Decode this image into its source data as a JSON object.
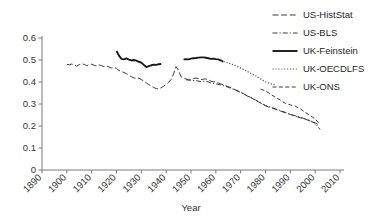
{
  "chart_data": {
    "type": "line",
    "title": "",
    "xlabel": "Year",
    "ylabel": "",
    "xlim": [
      1890,
      2010
    ],
    "ylim": [
      0,
      0.6
    ],
    "grid": false,
    "legend_position": "top-right",
    "xticks": [
      "1890",
      "1900",
      "1910",
      "1920",
      "1930",
      "1940",
      "1950",
      "1960",
      "1970",
      "1980",
      "1990",
      "2000",
      "2010"
    ],
    "yticks": [
      "0",
      "0.1",
      "0.2",
      "0.3",
      "0.4",
      "0.5",
      "0.6"
    ],
    "series": [
      {
        "name": "US-HistStat",
        "style": "long-dash",
        "color": "#3b3b3b",
        "x": [
          1900,
          1901,
          1902,
          1903,
          1904,
          1905,
          1906,
          1907,
          1908,
          1909,
          1910,
          1911,
          1912,
          1913,
          1914,
          1915,
          1916,
          1917,
          1918,
          1919,
          1920,
          1921,
          1922,
          1923,
          1924,
          1925,
          1926,
          1927,
          1928,
          1929,
          1930,
          1931,
          1932,
          1933,
          1934,
          1935,
          1936,
          1937,
          1938,
          1939,
          1940,
          1941,
          1942,
          1943,
          1944,
          1945,
          1946,
          1947,
          1948,
          1949,
          1950,
          1951,
          1952,
          1953,
          1954,
          1955,
          1956,
          1957,
          1958,
          1959,
          1960,
          1961,
          1962,
          1963,
          1964,
          1965,
          1966,
          1967,
          1968,
          1969,
          1970,
          1971,
          1972,
          1973,
          1974,
          1975,
          1976,
          1977,
          1978,
          1979,
          1980,
          1981,
          1982,
          1983,
          1984,
          1985,
          1986,
          1987,
          1988,
          1989,
          1990,
          1991,
          1992,
          1993,
          1994,
          1995,
          1996,
          1997,
          1998,
          1999,
          2000,
          2001,
          2002
        ],
        "y": [
          0.48,
          0.478,
          0.482,
          0.477,
          0.472,
          0.479,
          0.483,
          0.48,
          0.474,
          0.478,
          0.481,
          0.476,
          0.473,
          0.478,
          0.474,
          0.47,
          0.473,
          0.468,
          0.463,
          0.466,
          0.462,
          0.452,
          0.448,
          0.443,
          0.438,
          0.43,
          0.424,
          0.419,
          0.415,
          0.418,
          0.411,
          0.405,
          0.396,
          0.388,
          0.382,
          0.375,
          0.37,
          0.368,
          0.374,
          0.381,
          0.39,
          0.398,
          0.412,
          0.437,
          0.47,
          0.452,
          0.424,
          0.416,
          0.414,
          0.41,
          0.412,
          0.416,
          0.418,
          0.415,
          0.411,
          0.413,
          0.414,
          0.41,
          0.404,
          0.401,
          0.399,
          0.396,
          0.391,
          0.387,
          0.383,
          0.379,
          0.374,
          0.369,
          0.364,
          0.359,
          0.354,
          0.348,
          0.342,
          0.336,
          0.33,
          0.323,
          0.317,
          0.311,
          0.305,
          0.299,
          0.292,
          0.287,
          0.284,
          0.28,
          0.276,
          0.272,
          0.268,
          0.264,
          0.26,
          0.256,
          0.252,
          0.248,
          0.244,
          0.241,
          0.238,
          0.234,
          0.231,
          0.227,
          0.223,
          0.219,
          0.214,
          0.208,
          0.201
        ]
      },
      {
        "name": "US-BLS",
        "style": "dash-dot",
        "color": "#3b3b3b",
        "x": [
          1948,
          1950,
          1952,
          1954,
          1956,
          1958,
          1960,
          1962,
          1964,
          1966,
          1968,
          1970,
          1972,
          1974,
          1976,
          1978,
          1980,
          1982,
          1984,
          1986,
          1988,
          1990,
          1992,
          1994,
          1996,
          1998,
          2000,
          2002
        ],
        "y": [
          0.41,
          0.408,
          0.406,
          0.402,
          0.404,
          0.396,
          0.392,
          0.386,
          0.38,
          0.372,
          0.362,
          0.352,
          0.34,
          0.33,
          0.318,
          0.305,
          0.293,
          0.286,
          0.278,
          0.27,
          0.262,
          0.254,
          0.246,
          0.24,
          0.232,
          0.224,
          0.212,
          0.184
        ]
      },
      {
        "name": "UK-Feinstein",
        "style": "solid",
        "color": "#1a1a1a",
        "x": [
          1920,
          1921,
          1922,
          1923,
          1924,
          1925,
          1926,
          1927,
          1928,
          1929,
          1930,
          1931,
          1932,
          1933,
          1934,
          1935,
          1936,
          1937,
          1938,
          1947,
          1948,
          1949,
          1950,
          1951,
          1952,
          1953,
          1954,
          1955,
          1956,
          1957,
          1958,
          1959,
          1960,
          1961,
          1962,
          1963
        ],
        "y": [
          0.541,
          0.52,
          0.505,
          0.503,
          0.507,
          0.502,
          0.498,
          0.5,
          0.497,
          0.492,
          0.488,
          0.478,
          0.468,
          0.472,
          0.476,
          0.479,
          0.478,
          0.481,
          0.482,
          0.503,
          0.504,
          0.503,
          0.506,
          0.508,
          0.509,
          0.511,
          0.512,
          0.512,
          0.51,
          0.508,
          0.505,
          0.506,
          0.504,
          0.503,
          0.498,
          0.492
        ]
      },
      {
        "name": "UK-OECDLFS",
        "style": "dotted",
        "color": "#555555",
        "x": [
          1962,
          1964,
          1966,
          1968,
          1970,
          1972,
          1974,
          1976,
          1978,
          1980,
          1982,
          1984
        ],
        "y": [
          0.496,
          0.49,
          0.483,
          0.474,
          0.464,
          0.452,
          0.44,
          0.428,
          0.414,
          0.4,
          0.392,
          0.386
        ]
      },
      {
        "name": "UK-ONS",
        "style": "dash",
        "color": "#3b3b3b",
        "x": [
          1978,
          1980,
          1982,
          1984,
          1986,
          1988,
          1990,
          1992,
          1994,
          1996,
          1998,
          2000,
          2002
        ],
        "y": [
          0.368,
          0.36,
          0.345,
          0.33,
          0.318,
          0.303,
          0.296,
          0.29,
          0.278,
          0.262,
          0.248,
          0.232,
          0.206
        ]
      }
    ]
  },
  "legend": {
    "items": [
      {
        "label": "US-HistStat",
        "style": "long-dash"
      },
      {
        "label": "US-BLS",
        "style": "dash-dot"
      },
      {
        "label": "UK-Feinstein",
        "style": "solid"
      },
      {
        "label": "UK-OECDLFS",
        "style": "dotted"
      },
      {
        "label": "UK-ONS",
        "style": "dash"
      }
    ]
  }
}
